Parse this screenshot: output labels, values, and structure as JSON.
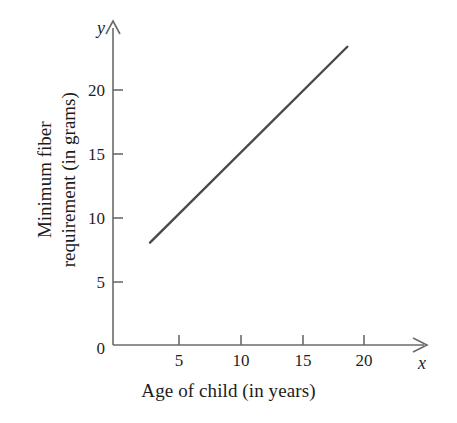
{
  "chart_data": {
    "type": "line",
    "title": "",
    "xlabel": "Age of child (in years)",
    "ylabel_line1": "Minimum fiber",
    "ylabel_line2": "requirement (in grams)",
    "ylabel": "Minimum fiber requirement (in grams)",
    "x_axis_symbol": "x",
    "y_axis_symbol": "y",
    "xlim": [
      0,
      25.6
    ],
    "ylim": [
      0,
      24.5
    ],
    "xticks": [
      5,
      10,
      15,
      20
    ],
    "xtick_labels": [
      "5",
      "10",
      "15",
      "20"
    ],
    "yticks": [
      5,
      10,
      15,
      20
    ],
    "ytick_labels": [
      "5",
      "10",
      "15",
      "20"
    ],
    "origin_label": "0",
    "grid": false,
    "legend": null,
    "series": [
      {
        "name": "Minimum fiber requirement",
        "x": [
          3,
          19
        ],
        "values": [
          8,
          23.3
        ],
        "color": "#4a4a4a",
        "line_width": 2.4
      }
    ],
    "axis_color": "#6b6b6b",
    "text_color": "#1c1c1c"
  }
}
